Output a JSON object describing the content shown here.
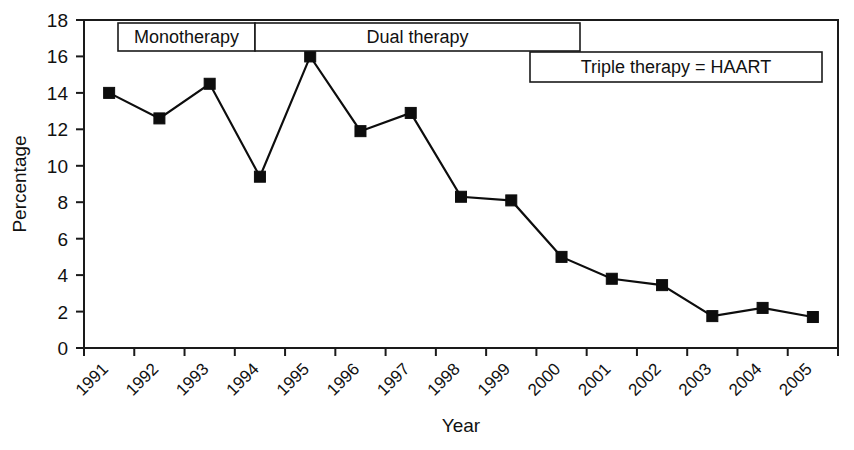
{
  "chart_data": {
    "type": "line",
    "title": "",
    "xlabel": "Year",
    "ylabel": "Percentage",
    "categories": [
      "1991",
      "1992",
      "1993",
      "1994",
      "1995",
      "1996",
      "1997",
      "1998",
      "1999",
      "2000",
      "2001",
      "2002",
      "2003",
      "2004",
      "2005"
    ],
    "values": [
      14.0,
      12.6,
      14.5,
      9.4,
      16.0,
      11.9,
      12.9,
      8.3,
      8.1,
      5.0,
      3.8,
      3.45,
      1.75,
      2.2,
      1.7
    ],
    "series": [
      {
        "name": "Percentage",
        "values": [
          14.0,
          12.6,
          14.5,
          9.4,
          16.0,
          11.9,
          12.9,
          8.3,
          8.1,
          5.0,
          3.8,
          3.45,
          1.75,
          2.2,
          1.7
        ],
        "marker": "filled-square",
        "color": "#0d0d0d"
      }
    ],
    "ylim": [
      0,
      18
    ],
    "yticks": [
      0,
      2,
      4,
      6,
      8,
      10,
      12,
      14,
      16,
      18
    ],
    "ytick_labels": [
      "0",
      "2",
      "4",
      "6",
      "8",
      "10",
      "12",
      "14",
      "16",
      "18"
    ],
    "grid": false,
    "legend": "none",
    "xtick_rotation": -45,
    "annotations": [
      {
        "id": "monotherapy",
        "label": "Monotherapy",
        "start_year": "1991",
        "end_year": "1994"
      },
      {
        "id": "dual-therapy",
        "label": "Dual therapy",
        "start_year": "1994",
        "end_year": "2000"
      },
      {
        "id": "triple-therapy",
        "label": "Triple therapy = HAART",
        "start_year": "2000",
        "end_year": "2005"
      }
    ]
  },
  "axes": {
    "y_title": "Percentage",
    "x_title": "Year"
  }
}
